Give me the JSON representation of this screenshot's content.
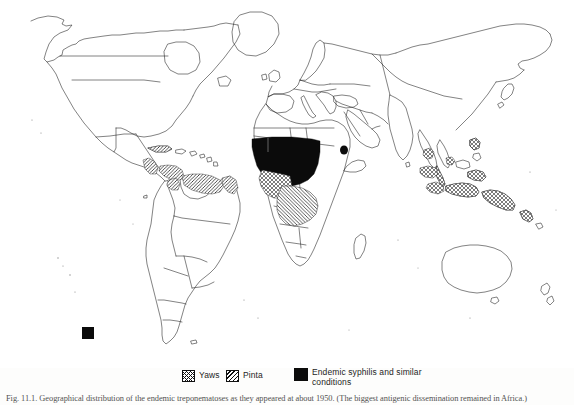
{
  "figure": {
    "caption": "Fig. 11.1. Geographical distribution of the endemic treponematoses as they appeared at about 1950. (The biggest antigenic dissemination remained in Africa.)",
    "legend_title": ""
  },
  "legend": {
    "items": [
      {
        "id": "yaws",
        "label": "Yaws",
        "pattern": "cross-hatch",
        "icon": "cross-hatch-swatch-icon"
      },
      {
        "id": "pinta",
        "label": "Pinta",
        "pattern": "diagonal-hatch",
        "icon": "diagonal-hatch-swatch-icon"
      },
      {
        "id": "syphilis",
        "label": "Endemic syphilis and similar conditions",
        "pattern": "solid-black",
        "icon": "solid-black-swatch-icon"
      }
    ]
  },
  "colors": {
    "ink": "#111111",
    "solid_fill": "#0b0b0b",
    "paper": "#ffffff",
    "caption_ink": "#2a2a2a"
  },
  "map": {
    "projection": "world-outline-political",
    "regions": [
      {
        "name": "West Africa and Sahel belt",
        "disease": "Endemic syphilis and similar conditions",
        "fill": "solid-black"
      },
      {
        "name": "Southern Africa (Namibia / Botswana)",
        "disease": "Yaws",
        "fill": "cross-hatch"
      },
      {
        "name": "Central Africa (Congo basin / Angola / Zambia)",
        "disease": "Pinta",
        "fill": "diagonal-hatch"
      },
      {
        "name": "Horn of Africa (Ethiopia / Somalia)",
        "disease": "Endemic syphilis and similar conditions",
        "fill": "solid-black"
      },
      {
        "name": "Central America and Caribbean",
        "disease": "Pinta",
        "fill": "diagonal-hatch"
      },
      {
        "name": "Northern South America (Colombia / Venezuela / Guianas / Amazon)",
        "disease": "Pinta",
        "fill": "diagonal-hatch"
      },
      {
        "name": "Indonesia / Malaysia / Borneo",
        "disease": "Yaws",
        "fill": "cross-hatch"
      },
      {
        "name": "New Guinea and Melanesia",
        "disease": "Yaws",
        "fill": "cross-hatch"
      },
      {
        "name": "Philippines and Indochina",
        "disease": "Yaws",
        "fill": "cross-hatch"
      },
      {
        "name": "South Pacific marker (scale square)",
        "disease": "Endemic syphilis and similar conditions",
        "fill": "solid-black"
      }
    ]
  }
}
